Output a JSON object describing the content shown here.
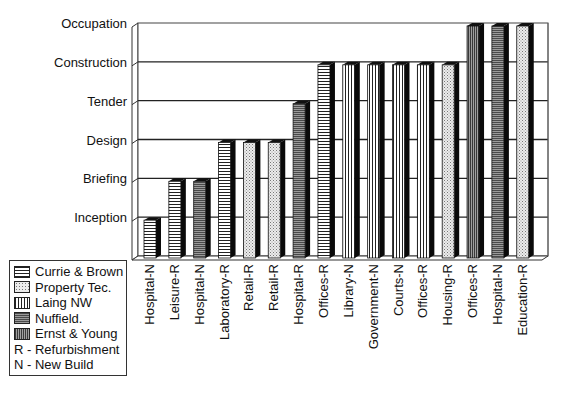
{
  "chart_data": {
    "type": "bar",
    "title": "",
    "xlabel": "",
    "ylabel": "",
    "y_levels": [
      "Inception",
      "Briefing",
      "Design",
      "Tender",
      "Construction",
      "Occupation"
    ],
    "categories": [
      "Hospital-N",
      "Leisure-R",
      "Hospital-N",
      "Laboratory-R",
      "Retail-R",
      "Retail-R",
      "Hospital-R",
      "Offices-R",
      "Library-N",
      "Government-N",
      "Courts-N",
      "Offices-R",
      "Housing-R",
      "Offices-R",
      "Hospital-N",
      "Education-R"
    ],
    "values": [
      1,
      2,
      2,
      3,
      3,
      3,
      4,
      5,
      5,
      5,
      5,
      5,
      5,
      6,
      6,
      6
    ],
    "value_labels": [
      "Inception",
      "Briefing",
      "Briefing",
      "Design",
      "Design",
      "Design",
      "Tender",
      "Construction",
      "Construction",
      "Construction",
      "Construction",
      "Construction",
      "Construction",
      "Occupation",
      "Occupation",
      "Occupation"
    ],
    "firms": [
      "Currie & Brown",
      "Currie & Brown",
      "Nuffield.",
      "Currie & Brown",
      "Property Tec.",
      "Property Tec.",
      "Nuffield.",
      "Currie & Brown",
      "Laing NW",
      "Laing NW",
      "Laing NW",
      "Laing NW",
      "Property Tec.",
      "Ernst & Young",
      "Nuffield.",
      "Property Tec."
    ],
    "ylim": [
      0,
      6
    ],
    "grid": true,
    "style": "3d-column",
    "legend_position": "bottom-left",
    "legend": [
      {
        "name": "Currie & Brown",
        "pattern": "horizontal-lines"
      },
      {
        "name": "Property Tec.",
        "pattern": "dots"
      },
      {
        "name": "Laing NW",
        "pattern": "vertical-lines"
      },
      {
        "name": "Nuffield.",
        "pattern": "dense-horizontal-dark"
      },
      {
        "name": "Ernst & Young",
        "pattern": "dense-vertical-dark"
      }
    ],
    "notes": [
      "R - Refurbishment",
      "N - New Build"
    ]
  },
  "legend": {
    "items": [
      {
        "label": "Currie & Brown",
        "pattern": "hlines"
      },
      {
        "label": "Property Tec.",
        "pattern": "dots"
      },
      {
        "label": "Laing NW",
        "pattern": "vlines"
      },
      {
        "label": "Nuffield.",
        "pattern": "hdense"
      },
      {
        "label": "Ernst & Young",
        "pattern": "vdense"
      }
    ],
    "notes": [
      "R - Refurbishment",
      "N - New Build"
    ]
  }
}
